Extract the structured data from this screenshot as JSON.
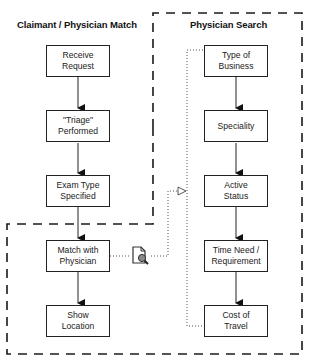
{
  "regions": {
    "left": {
      "title": "Claimant / Physician Match"
    },
    "right": {
      "title": "Physician Search"
    }
  },
  "left_flow": [
    {
      "id": "receive-request",
      "line1": "Receive",
      "line2": "Request"
    },
    {
      "id": "triage-performed",
      "line1": "\"Triage\"",
      "line2": "Performed"
    },
    {
      "id": "exam-type-specified",
      "line1": "Exam Type",
      "line2": "Specified"
    },
    {
      "id": "match-with-physician",
      "line1": "Match with",
      "line2": "Physician"
    },
    {
      "id": "show-location",
      "line1": "Show",
      "line2": "Location"
    }
  ],
  "right_flow": [
    {
      "id": "type-of-business",
      "line1": "Type of",
      "line2": "Business"
    },
    {
      "id": "speciality",
      "line1": "Speciality",
      "line2": ""
    },
    {
      "id": "active-status",
      "line1": "Active",
      "line2": "Status"
    },
    {
      "id": "time-need-requirement",
      "line1": "Time Need /",
      "line2": "Requirement"
    },
    {
      "id": "cost-of-travel",
      "line1": "Cost of",
      "line2": "Travel"
    }
  ],
  "connector": {
    "icon": "document-search-icon",
    "from": "Match with Physician",
    "to": "Physician Search"
  },
  "colors": {
    "line": "#222222",
    "dashed": "#1a1a1a",
    "dotted": "#555555",
    "background": "#ffffff"
  }
}
